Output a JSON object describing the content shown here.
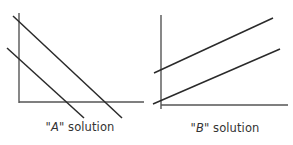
{
  "figure": {
    "panels": [
      {
        "id": "A",
        "caption": {
          "open_quote": "\"",
          "letter": "A",
          "close_text": "\" solution"
        },
        "axes": {
          "y_axis": {
            "x1": 19,
            "y1": 13,
            "x2": 19,
            "y2": 103
          },
          "x_axis": {
            "x1": 19,
            "y1": 102,
            "x2": 144,
            "y2": 102
          }
        },
        "lines": [
          {
            "name": "upper-line",
            "x1": 13,
            "y1": 16,
            "x2": 122,
            "y2": 118
          },
          {
            "name": "lower-line",
            "x1": 7,
            "y1": 48,
            "x2": 84,
            "y2": 118
          }
        ],
        "caption_pos": {
          "x": 80,
          "y": 120
        }
      },
      {
        "id": "B",
        "caption": {
          "open_quote": "\"",
          "letter": "B",
          "close_text": "\" solution"
        },
        "axes": {
          "y_axis": {
            "x1": 161,
            "y1": 15,
            "x2": 161,
            "y2": 109
          },
          "x_axis": {
            "x1": 161,
            "y1": 105,
            "x2": 288,
            "y2": 105
          }
        },
        "lines": [
          {
            "name": "upper-line",
            "x1": 154,
            "y1": 73,
            "x2": 273,
            "y2": 18
          },
          {
            "name": "lower-line",
            "x1": 153,
            "y1": 104,
            "x2": 280,
            "y2": 49
          }
        ],
        "caption_pos": {
          "x": 225,
          "y": 121
        }
      }
    ]
  },
  "colors": {
    "axis": "#555555",
    "line": "#2a2a2a",
    "text": "#333333",
    "background": "#ffffff"
  }
}
